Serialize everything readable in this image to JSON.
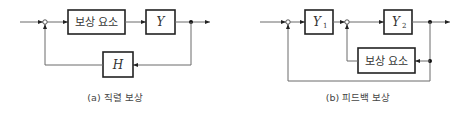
{
  "diagram_a": {
    "compensator_label": "보상 요소",
    "plant_label": "Y",
    "feedback_label": "H",
    "caption": "(a) 직렬 보상"
  },
  "diagram_b": {
    "block1_label": "Y",
    "block1_sub": "1",
    "block2_label": "Y",
    "block2_sub": "2",
    "compensator_label": "보상 요소",
    "caption": "(b) 피드백 보상"
  }
}
